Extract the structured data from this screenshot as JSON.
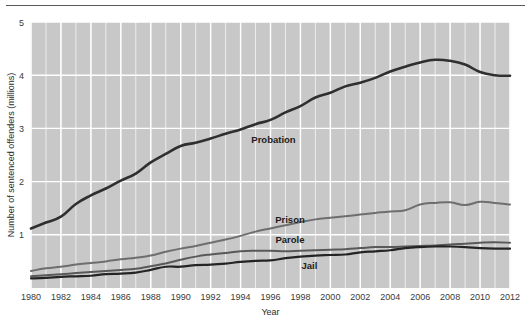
{
  "figure": {
    "has_top_rule": true,
    "background_color": "#ffffff",
    "plot_background_color": "#c8c8c8",
    "gridline_color": "#ffffff",
    "minor_gridline_color": "#ededed"
  },
  "chart_data": {
    "type": "line",
    "title": "",
    "xlabel": "Year",
    "ylabel": "Number of sentenced offenders (millions)",
    "x": [
      1980,
      1981,
      1982,
      1983,
      1984,
      1985,
      1986,
      1987,
      1988,
      1989,
      1990,
      1991,
      1992,
      1993,
      1994,
      1995,
      1996,
      1997,
      1998,
      1999,
      2000,
      2001,
      2002,
      2003,
      2004,
      2005,
      2006,
      2007,
      2008,
      2009,
      2010,
      2011,
      2012
    ],
    "xlim": [
      1980,
      2012
    ],
    "ylim": [
      0,
      5
    ],
    "xticks": [
      1980,
      1982,
      1984,
      1986,
      1988,
      1990,
      1992,
      1994,
      1996,
      1998,
      2000,
      2002,
      2004,
      2006,
      2008,
      2010,
      2012
    ],
    "xticklabels": [
      "1980",
      "1982",
      "1984",
      "1986",
      "1988",
      "1990",
      "1992",
      "1994",
      "1996",
      "1998",
      "2000",
      "2002",
      "2004",
      "2006",
      "2008",
      "2010",
      "2012"
    ],
    "yticks": [
      1,
      2,
      3,
      4,
      5
    ],
    "yticklabels": [
      "1",
      "2",
      "3",
      "4",
      "5"
    ],
    "grid": true,
    "minor_grid_x": true,
    "legend": "inline-labels",
    "series": [
      {
        "name": "Probation",
        "color": "#2f2f2f",
        "width": 2.6,
        "label_x": 1996.2,
        "label_y": 2.72,
        "values": [
          1.12,
          1.23,
          1.34,
          1.58,
          1.74,
          1.87,
          2.02,
          2.15,
          2.36,
          2.52,
          2.67,
          2.73,
          2.81,
          2.9,
          2.98,
          3.08,
          3.16,
          3.3,
          3.42,
          3.58,
          3.67,
          3.79,
          3.86,
          3.95,
          4.07,
          4.16,
          4.24,
          4.29,
          4.27,
          4.2,
          4.06,
          4.0,
          3.99
        ]
      },
      {
        "name": "Prison",
        "color": "#6e6e6e",
        "width": 2.0,
        "label_x": 1997.3,
        "label_y": 1.23,
        "values": [
          0.32,
          0.37,
          0.4,
          0.44,
          0.47,
          0.5,
          0.54,
          0.57,
          0.61,
          0.68,
          0.74,
          0.79,
          0.85,
          0.91,
          0.98,
          1.06,
          1.12,
          1.18,
          1.24,
          1.29,
          1.32,
          1.35,
          1.38,
          1.41,
          1.44,
          1.46,
          1.57,
          1.6,
          1.61,
          1.56,
          1.62,
          1.6,
          1.57
        ]
      },
      {
        "name": "Parole",
        "color": "#595959",
        "width": 2.0,
        "label_x": 1997.3,
        "label_y": 0.84,
        "values": [
          0.22,
          0.24,
          0.26,
          0.28,
          0.3,
          0.32,
          0.34,
          0.36,
          0.41,
          0.46,
          0.53,
          0.59,
          0.63,
          0.66,
          0.69,
          0.7,
          0.7,
          0.69,
          0.7,
          0.71,
          0.72,
          0.73,
          0.75,
          0.77,
          0.77,
          0.78,
          0.79,
          0.8,
          0.82,
          0.83,
          0.85,
          0.86,
          0.85
        ]
      },
      {
        "name": "Jail",
        "color": "#242424",
        "width": 2.2,
        "label_x": 1998.6,
        "label_y": 0.35,
        "values": [
          0.18,
          0.19,
          0.21,
          0.22,
          0.23,
          0.26,
          0.27,
          0.29,
          0.34,
          0.4,
          0.4,
          0.43,
          0.44,
          0.46,
          0.49,
          0.51,
          0.52,
          0.56,
          0.59,
          0.61,
          0.62,
          0.63,
          0.67,
          0.69,
          0.71,
          0.75,
          0.77,
          0.78,
          0.78,
          0.77,
          0.75,
          0.74,
          0.74
        ]
      }
    ]
  }
}
